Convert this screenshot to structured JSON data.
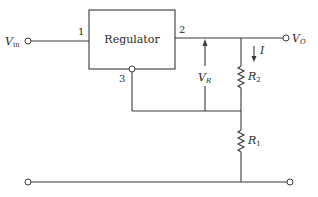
{
  "diagram": {
    "type": "circuit-schematic",
    "block": {
      "label": "Regulator",
      "pins": {
        "pin1": "1",
        "pin2": "2",
        "pin3": "3"
      }
    },
    "terminals": {
      "input": {
        "label_main": "V",
        "label_sub": "in"
      },
      "output": {
        "label_main": "V",
        "label_sub": "O"
      }
    },
    "components": {
      "r2": {
        "label_main": "R",
        "label_sub": "2"
      },
      "r1": {
        "label_main": "R",
        "label_sub": "1"
      }
    },
    "annotations": {
      "current": {
        "label": "I"
      },
      "reference_voltage": {
        "label_main": "V",
        "label_sub": "R"
      }
    },
    "colors": {
      "line": "#3a3a3a",
      "text": "#2a2a2a",
      "background": "#ffffff"
    }
  }
}
